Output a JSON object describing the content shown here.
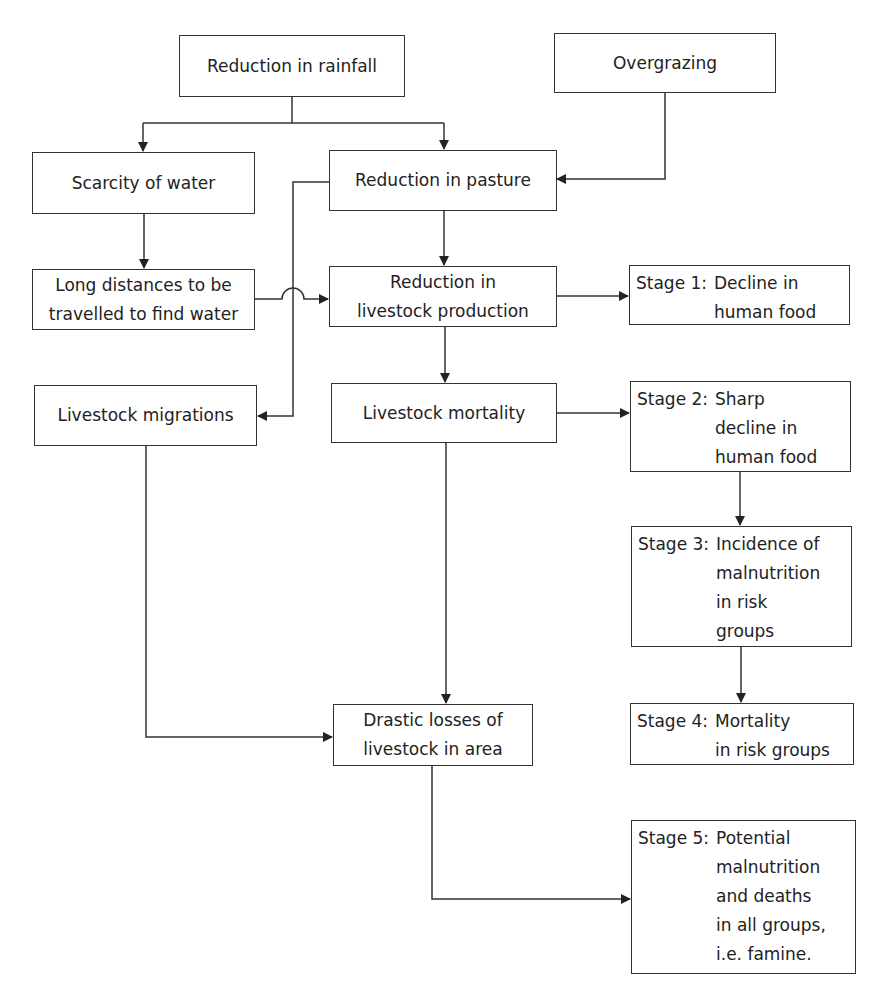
{
  "diagram": {
    "type": "flowchart",
    "nodes": {
      "rainfall": {
        "lines": [
          "Reduction in rainfall"
        ]
      },
      "overgrazing": {
        "lines": [
          "Overgrazing"
        ]
      },
      "scarcity": {
        "lines": [
          "Scarcity of water"
        ]
      },
      "pasture": {
        "lines": [
          "Reduction in pasture"
        ]
      },
      "distances": {
        "lines": [
          "Long distances to be",
          "travelled to find water"
        ]
      },
      "production": {
        "lines": [
          "Reduction in",
          "livestock production"
        ]
      },
      "migrations": {
        "lines": [
          "Livestock migrations"
        ]
      },
      "mortality": {
        "lines": [
          "Livestock mortality"
        ]
      },
      "losses": {
        "lines": [
          "Drastic losses of",
          "livestock in area"
        ]
      },
      "stage1": {
        "label": "Stage 1:",
        "lines": [
          "Decline in",
          "human food"
        ]
      },
      "stage2": {
        "label": "Stage 2:",
        "lines": [
          "Sharp",
          "decline in",
          "human food"
        ]
      },
      "stage3": {
        "label": "Stage 3:",
        "lines": [
          "Incidence of",
          "malnutrition",
          "in risk",
          "groups"
        ]
      },
      "stage4": {
        "label": "Stage 4:",
        "lines": [
          "Mortality",
          "in risk groups"
        ]
      },
      "stage5": {
        "label": "Stage 5:",
        "lines": [
          "Potential",
          "malnutrition",
          "and deaths",
          "in all groups,",
          "i.e. famine."
        ]
      }
    },
    "edges": [
      [
        "Reduction in rainfall",
        "Scarcity of water"
      ],
      [
        "Reduction in rainfall",
        "Reduction in pasture"
      ],
      [
        "Overgrazing",
        "Reduction in pasture"
      ],
      [
        "Scarcity of water",
        "Long distances to be travelled to find water"
      ],
      [
        "Long distances to be travelled to find water",
        "Reduction in livestock production"
      ],
      [
        "Reduction in pasture",
        "Reduction in livestock production"
      ],
      [
        "Reduction in pasture",
        "Livestock migrations"
      ],
      [
        "Reduction in livestock production",
        "Stage 1: Decline in human food"
      ],
      [
        "Reduction in livestock production",
        "Livestock mortality"
      ],
      [
        "Livestock mortality",
        "Stage 2: Sharp decline in human food"
      ],
      [
        "Livestock mortality",
        "Drastic losses of livestock in area"
      ],
      [
        "Livestock migrations",
        "Drastic losses of livestock in area"
      ],
      [
        "Stage 2: Sharp decline in human food",
        "Stage 3: Incidence of malnutrition in risk groups"
      ],
      [
        "Stage 3: Incidence of malnutrition in risk groups",
        "Stage 4: Mortality in risk groups"
      ],
      [
        "Drastic losses of livestock in area",
        "Stage 5: Potential malnutrition and deaths in all groups, i.e. famine."
      ]
    ]
  }
}
